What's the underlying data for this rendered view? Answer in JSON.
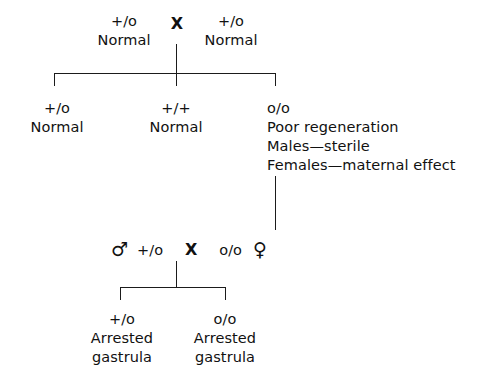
{
  "diagram": {
    "cross_symbol": "X",
    "male_symbol": "♂",
    "female_symbol": "♀",
    "line_color": "#1b1b1b",
    "background_color": "#ffffff"
  },
  "generation_p": {
    "parent_left": {
      "genotype": "+/o",
      "phenotype": "Normal"
    },
    "parent_right": {
      "genotype": "+/o",
      "phenotype": "Normal"
    }
  },
  "generation_f1": {
    "offspring": [
      {
        "genotype": "+/o",
        "lines": [
          "Normal"
        ]
      },
      {
        "genotype": "+/+",
        "lines": [
          "Normal"
        ]
      },
      {
        "genotype": "o/o",
        "lines": [
          "Poor regeneration",
          "Males—sterile",
          "Females—maternal effect"
        ]
      }
    ]
  },
  "second_cross": {
    "male_symbol": "♂",
    "male_genotype": "+/o",
    "cross_symbol": "X",
    "female_genotype": "o/o",
    "female_symbol": "♀"
  },
  "generation_f2": {
    "offspring": [
      {
        "genotype": "+/o",
        "line1": "Arrested",
        "line2": "gastrula"
      },
      {
        "genotype": "o/o",
        "line1": "Arrested",
        "line2": "gastrula"
      }
    ]
  }
}
